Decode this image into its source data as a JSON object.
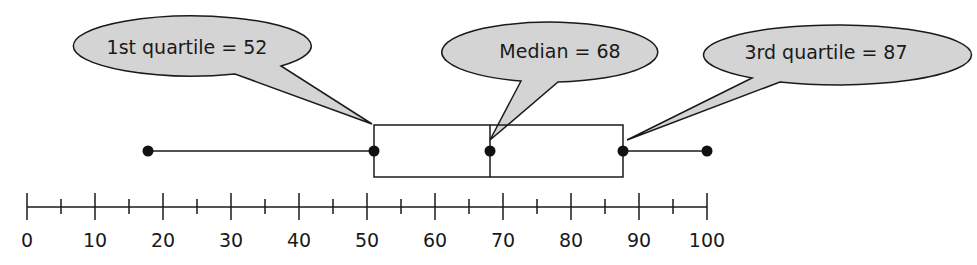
{
  "chart_data": {
    "type": "boxplot",
    "title": "",
    "xlabel": "",
    "ylabel": "",
    "xlim": [
      0,
      100
    ],
    "major_ticks": [
      0,
      10,
      20,
      30,
      40,
      50,
      60,
      70,
      80,
      90,
      100
    ],
    "minor_ticks": [
      5,
      15,
      25,
      35,
      45,
      55,
      65,
      75,
      85,
      95
    ],
    "tick_labels": [
      "0",
      "10",
      "20",
      "30",
      "40",
      "50",
      "60",
      "70",
      "80",
      "90",
      "100"
    ],
    "min": 18,
    "q1": 52,
    "median": 68,
    "q3": 87,
    "max": 100,
    "annotations": [
      {
        "text": "1st quartile = 52",
        "target": "q1"
      },
      {
        "text": "Median = 68",
        "target": "median"
      },
      {
        "text": "3rd quartile = 87",
        "target": "q3"
      }
    ],
    "grid": false,
    "legend": null
  },
  "callouts": {
    "q1_label": "1st quartile = 52",
    "median_label": "Median = 68",
    "q3_label": "3rd quartile = 87"
  },
  "axis": {
    "labels": [
      "0",
      "10",
      "20",
      "30",
      "40",
      "50",
      "60",
      "70",
      "80",
      "90",
      "100"
    ]
  },
  "colors": {
    "callout_fill": "#d4d4d4",
    "stroke": "#1a1a1a",
    "background": "#ffffff"
  }
}
